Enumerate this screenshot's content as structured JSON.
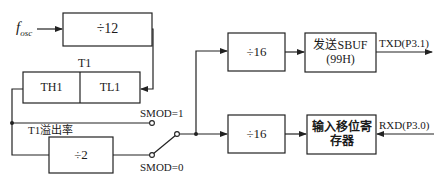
{
  "diagram": {
    "type": "block-diagram",
    "colors": {
      "line": "#222222",
      "background": "#ffffff"
    },
    "input": {
      "label_main": "f",
      "label_sub": "osc"
    },
    "blocks": {
      "div12": {
        "label": "÷12"
      },
      "timer": {
        "title": "T1",
        "high": "TH1",
        "low": "TL1"
      },
      "div2": {
        "label": "÷2"
      },
      "div16_tx": {
        "label": "÷16"
      },
      "div16_rx": {
        "label": "÷16"
      },
      "tx_sbuf": {
        "line1": "发送SBUF",
        "line2": "(99H)"
      },
      "rx_shift": {
        "line1": "输入移位寄",
        "line2": "存器"
      }
    },
    "labels": {
      "overflow": "T1溢出率",
      "smod1": "SMOD=1",
      "smod0": "SMOD=0",
      "txd": "TXD(P3.1)",
      "rxd": "RXD(P3.0)"
    }
  }
}
